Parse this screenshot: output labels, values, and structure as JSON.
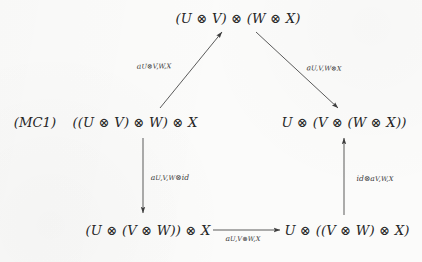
{
  "figure": {
    "tag": "(MC1)",
    "kind": "commutative-diagram"
  },
  "nodes": {
    "top": "(U ⊗ V) ⊗ (W ⊗ X)",
    "left_mid": "((U ⊗ V) ⊗ W) ⊗ X",
    "right_mid": "U ⊗ (V ⊗ (W ⊗ X))",
    "bottom_left": "(U ⊗ (V ⊗ W)) ⊗ X",
    "bottom_right": "U ⊗ ((V ⊗ W) ⊗ X)"
  },
  "arrows": [
    {
      "id": "left-diagonal",
      "from": "left_mid",
      "to": "top",
      "direction": "up-right",
      "label_base": "a",
      "label_sub": "U⊗V,W,X",
      "label_full": "a_{U⊗V,W,X}"
    },
    {
      "id": "right-diagonal",
      "from": "top",
      "to": "right_mid",
      "direction": "down-right",
      "label_base": "a",
      "label_sub": "U,V,W⊗X",
      "label_full": "a_{U,V,W⊗X}"
    },
    {
      "id": "left-vertical",
      "from": "left_mid",
      "to": "bottom_left",
      "direction": "down",
      "label_base": "a",
      "label_sub": "U,V,W",
      "label_suffix": "⊗id",
      "label_full": "a_{U,V,W}⊗id"
    },
    {
      "id": "right-vertical",
      "from": "bottom_right",
      "to": "right_mid",
      "direction": "up",
      "label_prefix": "id⊗",
      "label_base": "a",
      "label_sub": "V,W,X",
      "label_full": "id⊗a_{V,W,X}"
    },
    {
      "id": "bottom-horizontal",
      "from": "bottom_left",
      "to": "bottom_right",
      "direction": "right",
      "label_base": "a",
      "label_sub": "U,V⊗W,X",
      "label_full": "a_{U,V⊗W,X}"
    }
  ],
  "colors": {
    "background": "#fbfbfa",
    "ink": "#262626",
    "stroke": "#3d3d3d"
  }
}
